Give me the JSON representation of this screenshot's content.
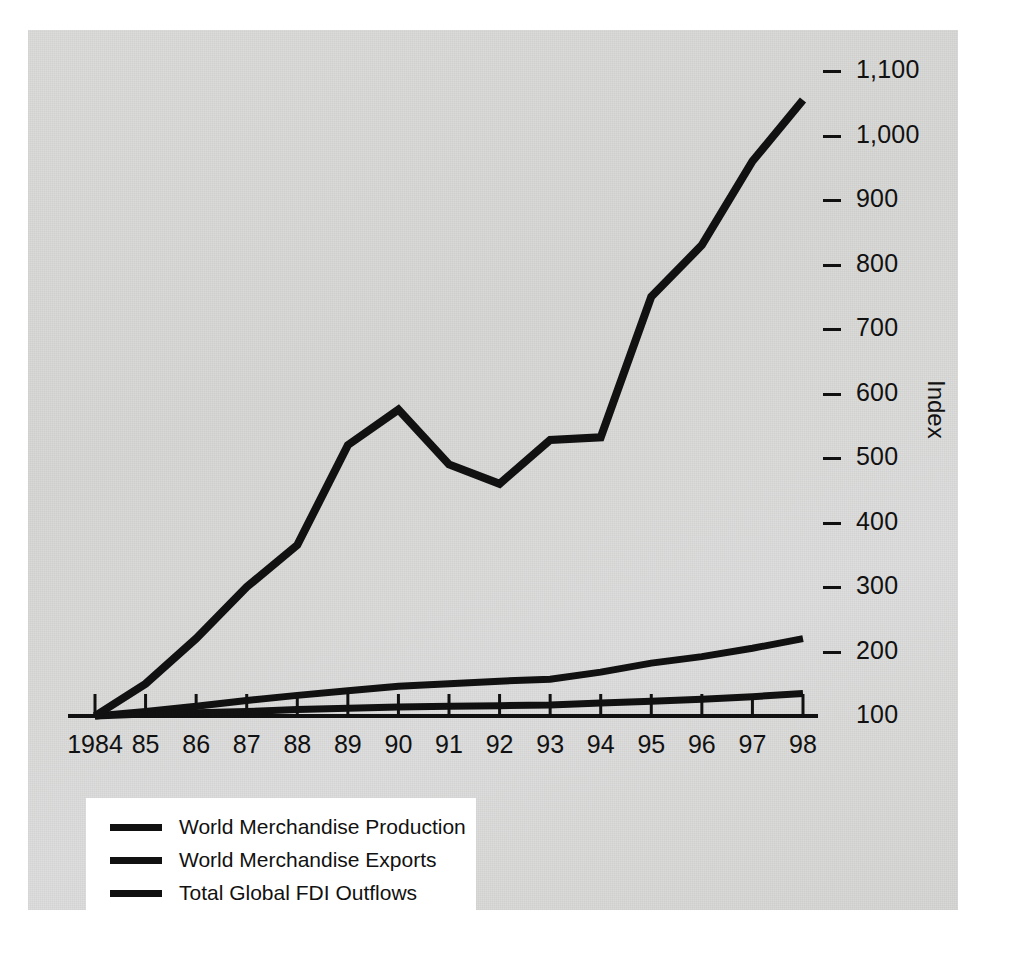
{
  "chart_data": {
    "type": "line",
    "title": "",
    "subtitle": "",
    "xlabel": "",
    "ylabel": "Index",
    "x": [
      1984,
      1985,
      1986,
      1987,
      1988,
      1989,
      1990,
      1991,
      1992,
      1993,
      1994,
      1995,
      1996,
      1997,
      1998
    ],
    "categories": [
      "1984",
      "85",
      "86",
      "87",
      "88",
      "89",
      "90",
      "91",
      "92",
      "93",
      "94",
      "95",
      "96",
      "97",
      "98"
    ],
    "ylim": [
      100,
      1100
    ],
    "yticks": [
      100,
      200,
      300,
      400,
      500,
      600,
      700,
      800,
      900,
      1000,
      1100
    ],
    "ytick_labels": [
      "100",
      "200",
      "300",
      "400",
      "500",
      "600",
      "700",
      "800",
      "900",
      "1,000",
      "1,100"
    ],
    "grid": false,
    "legend_position": "bottom-left",
    "series": [
      {
        "name": "Total Global FDI Outflows",
        "color": "#111111",
        "values": [
          100,
          150,
          220,
          300,
          365,
          520,
          575,
          490,
          460,
          528,
          532,
          750,
          830,
          960,
          1055
        ]
      },
      {
        "name": "World Merchandise Exports",
        "color": "#111111",
        "values": [
          100,
          107,
          115,
          124,
          132,
          139,
          146,
          150,
          154,
          157,
          168,
          182,
          192,
          205,
          220
        ]
      },
      {
        "name": "World Merchandise Production",
        "color": "#111111",
        "values": [
          100,
          103,
          105,
          107,
          110,
          112,
          114,
          115,
          116,
          117,
          120,
          123,
          126,
          130,
          135
        ]
      }
    ]
  },
  "legend": {
    "items": [
      {
        "label": "World Merchandise Production"
      },
      {
        "label": "World Merchandise Exports"
      },
      {
        "label": "Total Global FDI Outflows"
      }
    ]
  },
  "axis": {
    "y_title": "Index"
  }
}
